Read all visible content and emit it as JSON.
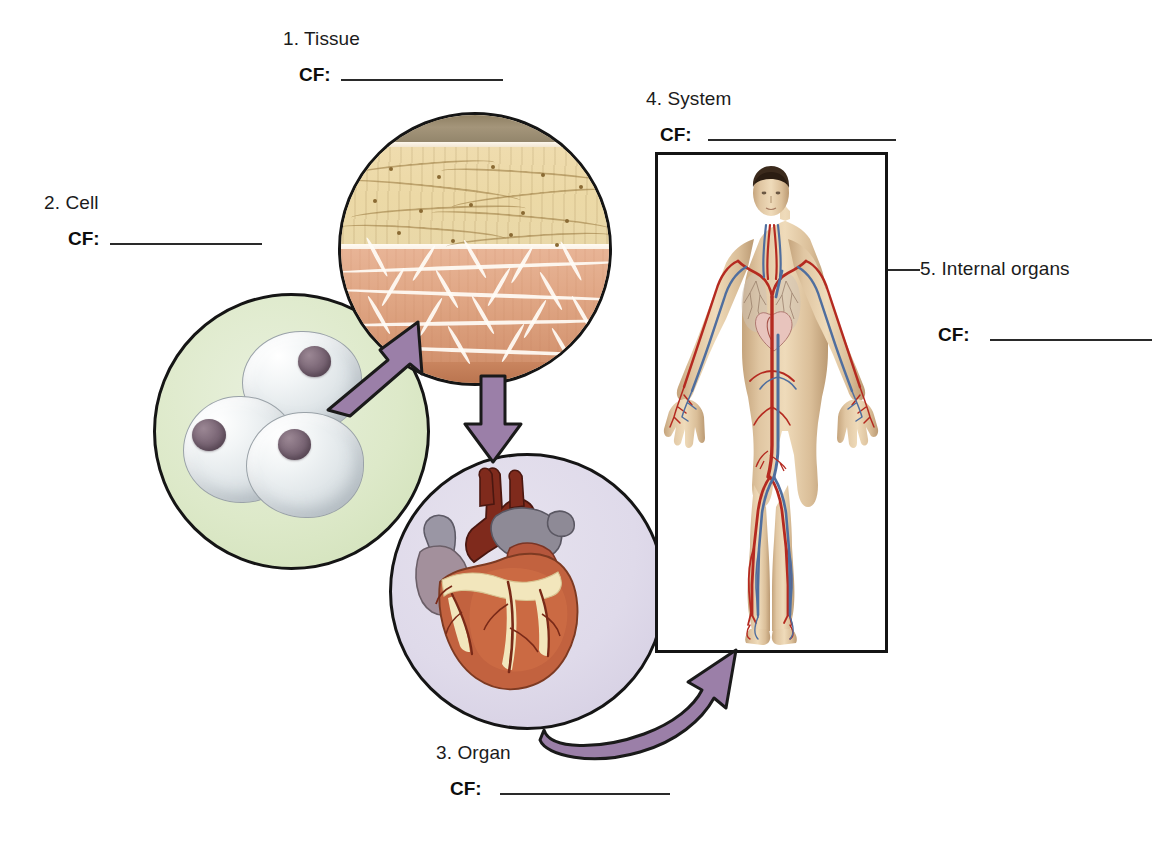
{
  "diagram": {
    "title_implicit": "Levels of organization: cell, tissue, organ, system",
    "cf_tag": "CF:",
    "labels": [
      {
        "id": "tissue",
        "number": "1.",
        "text": "1. Tissue",
        "cf": "CF:",
        "cf_value": ""
      },
      {
        "id": "cell",
        "number": "2.",
        "text": "2. Cell",
        "cf": "CF:",
        "cf_value": ""
      },
      {
        "id": "organ",
        "number": "3.",
        "text": "3. Organ",
        "cf": "CF:",
        "cf_value": ""
      },
      {
        "id": "system",
        "number": "4.",
        "text": "4. System",
        "cf": "CF:",
        "cf_value": ""
      },
      {
        "id": "internal-organs",
        "number": "5.",
        "text": "5. Internal organs",
        "cf": "CF:",
        "cf_value": ""
      }
    ],
    "illustrations": [
      {
        "id": "cell-circle",
        "name": "cell-cluster-illustration",
        "description": "three translucent cells with nuclei on pale green field"
      },
      {
        "id": "tissue-circle",
        "name": "tissue-section-illustration",
        "description": "layered tissue cross-section, epithelium over connective and muscle layers"
      },
      {
        "id": "organ-circle",
        "name": "heart-illustration",
        "description": "human heart with aorta, pulmonary vessels and coronary arteries"
      },
      {
        "id": "system-box",
        "name": "circulatory-system-illustration",
        "description": "full male body showing arteries and veins"
      }
    ],
    "arrows": [
      {
        "id": "cell-to-tissue",
        "from": "cell",
        "to": "tissue",
        "shape": "straight-diagonal"
      },
      {
        "id": "tissue-to-organ",
        "from": "tissue",
        "to": "organ",
        "shape": "straight-vertical"
      },
      {
        "id": "organ-to-system",
        "from": "organ",
        "to": "system",
        "shape": "curved"
      }
    ],
    "colors": {
      "arrow_fill": "#9b7fa8",
      "arrow_outline": "#1a1a1a",
      "cell_field": "#dde9c9",
      "organ_field": "#dfdaea",
      "outline": "#151515",
      "text": "#1b1b1b"
    }
  }
}
